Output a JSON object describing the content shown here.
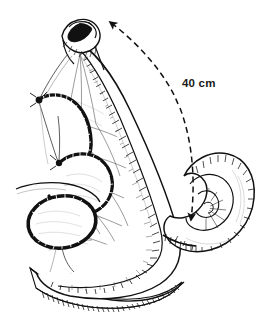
{
  "figure": {
    "kind": "surgical-line-drawing",
    "background_color": "#ffffff",
    "ink_color": "#111111",
    "shade_color": "#555555",
    "width": 275,
    "height": 322
  },
  "annotations": {
    "measurement": {
      "text": "40 cm",
      "x": 182,
      "y": 78,
      "color": "#1a1a1a"
    }
  },
  "markers": {
    "proximal_arrow": {
      "name": "dashed-arrow-up",
      "direction": "up-right",
      "tip_x": 104,
      "tip_y": 17
    },
    "distal_arrow": {
      "name": "dashed-arrow-down",
      "direction": "down",
      "tip_x": 190,
      "tip_y": 227
    },
    "dash_pattern": "6 4",
    "dash_color": "#111111"
  },
  "structures": [
    {
      "id": "bowel-stump",
      "label": "open cut bowel end",
      "lumen_color": "#111111"
    },
    {
      "id": "bowel-limb",
      "label": "long bowel limb with serosal hatching"
    },
    {
      "id": "mesentery-fan",
      "label": "mesenteric fan with vascular arcades"
    },
    {
      "id": "staple-line-upper",
      "label": "upper stapled anastomosis line"
    },
    {
      "id": "staple-line-lower",
      "label": "lower stapled loop"
    },
    {
      "id": "coiled-bowel",
      "label": "coiled distal bowel segment"
    },
    {
      "id": "bowel-sweep-bottom",
      "label": "inferior bowel sweep"
    }
  ]
}
